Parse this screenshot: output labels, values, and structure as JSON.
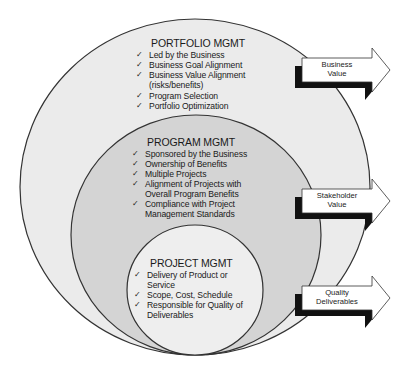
{
  "diagram": {
    "type": "nested-circles",
    "colors": {
      "background": "#ffffff",
      "outer_fill": "#ebebeb",
      "middle_fill": "#d4d4d4",
      "inner_fill": "#eeeeee",
      "stroke": "#333333",
      "arrow_body": "#ffffff",
      "arrow_shadow": "#111111"
    },
    "portfolio": {
      "title": "PORTFOLIO MGMT",
      "items": [
        {
          "check": "✓",
          "text": "Led by the Business",
          "sub": ""
        },
        {
          "check": "✓",
          "text": "Business Goal Alignment",
          "sub": ""
        },
        {
          "check": "✓",
          "text": "Business Value Alignment",
          "sub": "(risks/benefits)"
        },
        {
          "check": "✓",
          "text": "Program Selection",
          "sub": ""
        },
        {
          "check": "✓",
          "text": "Portfolio Optimization",
          "sub": ""
        }
      ]
    },
    "program": {
      "title": "PROGRAM MGMT",
      "items": [
        {
          "check": "✓",
          "text": "Sponsored by the Business",
          "sub": ""
        },
        {
          "check": "✓",
          "text": "Ownership of Benefits",
          "sub": ""
        },
        {
          "check": "✓",
          "text": "Multiple Projects",
          "sub": ""
        },
        {
          "check": "✓",
          "text": "Alignment of Projects with",
          "sub": "Overall Program Benefits"
        },
        {
          "check": "✓",
          "text": "Compliance with Project",
          "sub": "Management Standards"
        }
      ]
    },
    "project": {
      "title": "PROJECT MGMT",
      "items": [
        {
          "check": "✓",
          "text": "Delivery of Product or",
          "sub": "Service"
        },
        {
          "check": "✓",
          "text": "Scope, Cost, Schedule",
          "sub": ""
        },
        {
          "check": "✓",
          "text": "Responsible for Quality of",
          "sub": "Deliverables"
        }
      ]
    },
    "arrows": [
      {
        "line1": "Business",
        "line2": "Value"
      },
      {
        "line1": "Stakeholder",
        "line2": "Value"
      },
      {
        "line1": "Quality",
        "line2": "Deliverables"
      }
    ]
  }
}
